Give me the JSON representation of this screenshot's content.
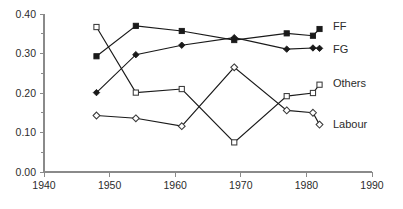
{
  "chart_data": {
    "type": "line",
    "title": "",
    "subtitle": "",
    "xlabel": "",
    "ylabel": "",
    "xlim": [
      1940,
      1990
    ],
    "ylim": [
      0.0,
      0.4
    ],
    "grid": false,
    "legend_position": "right-inline",
    "x_ticks": [
      1940,
      1950,
      1960,
      1970,
      1980,
      1990
    ],
    "x_tick_labels": [
      "1940",
      "1950",
      "1960",
      "1970",
      "1980",
      "1990"
    ],
    "x_minor_ticks": [
      1945,
      1955,
      1965,
      1975,
      1985
    ],
    "y_ticks": [
      0.0,
      0.1,
      0.2,
      0.3,
      0.4
    ],
    "y_tick_labels": [
      "0.00",
      "0.10",
      "0.20",
      "0.30",
      "0.40"
    ],
    "y_minor_ticks": [
      0.05,
      0.15,
      0.25,
      0.35
    ],
    "x": [
      1948,
      1954,
      1961,
      1969,
      1977,
      1981,
      1982
    ],
    "series": [
      {
        "name": "FF",
        "label": "FF",
        "marker": "filled-square",
        "color": "#1a1a1a",
        "label_y": 0.368,
        "values": [
          0.293,
          0.37,
          0.357,
          0.334,
          0.351,
          0.345,
          0.362
        ]
      },
      {
        "name": "FG",
        "label": "FG",
        "marker": "filled-diamond",
        "color": "#1a1a1a",
        "label_y": 0.308,
        "values": [
          0.201,
          0.297,
          0.321,
          0.34,
          0.311,
          0.314,
          0.313
        ]
      },
      {
        "name": "Others",
        "label": "Others",
        "marker": "open-square",
        "color": "#3a3a3a",
        "label_y": 0.222,
        "values": [
          0.367,
          0.201,
          0.21,
          0.075,
          0.192,
          0.2,
          0.221
        ]
      },
      {
        "name": "Labour",
        "label": "Labour",
        "marker": "open-diamond",
        "color": "#3a3a3a",
        "label_y": 0.118,
        "values": [
          0.143,
          0.136,
          0.116,
          0.265,
          0.156,
          0.15,
          0.12
        ]
      }
    ]
  },
  "geometry": {
    "plot_left": 44,
    "plot_right": 372,
    "plot_bottom": 172,
    "plot_top": 14,
    "label_x": 333
  }
}
